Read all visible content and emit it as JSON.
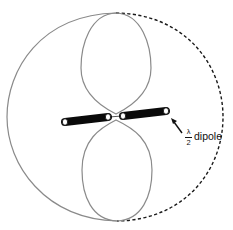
{
  "diagram": {
    "label": {
      "numerator": "λ",
      "denominator": "2",
      "text": "dipole"
    },
    "elements": {
      "outer_pattern_solid": "left half of outer circular pattern (solid gray)",
      "outer_pattern_dashed": "right half of outer circular pattern (dashed black)",
      "lobes": [
        "upper lobe",
        "lower lobe"
      ],
      "dipole": [
        "left rod",
        "right rod"
      ],
      "pointer": "arrow pointing to dipole end"
    },
    "colors": {
      "pattern_line": "#8a8a8a",
      "dashed_line": "#1a1a1a",
      "rod": "#0a0a0a",
      "rod_end": "#ffffff",
      "text": "#111111"
    }
  }
}
